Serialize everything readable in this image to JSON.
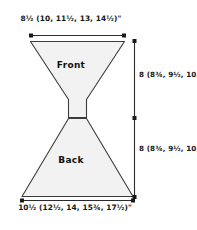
{
  "diagram": {
    "pieces": [
      {
        "name": "Front",
        "label": "Front"
      },
      {
        "name": "Back",
        "label": "Back"
      }
    ],
    "measurements": {
      "top_width": "8½ (10, 11½, 13, 14½)\"",
      "bottom_width": "10½ (12½, 14, 15¾, 17½)\"",
      "front_height": "8 (8¾, 9½, 10, 10½)\"",
      "back_height": "8 (8¾, 9½, 10, 10½)\""
    },
    "colors": {
      "fill": "#f2f2f2",
      "stroke": "#3c3c3c",
      "dimension_line": "#2b2b2b",
      "text": "#161616"
    }
  }
}
